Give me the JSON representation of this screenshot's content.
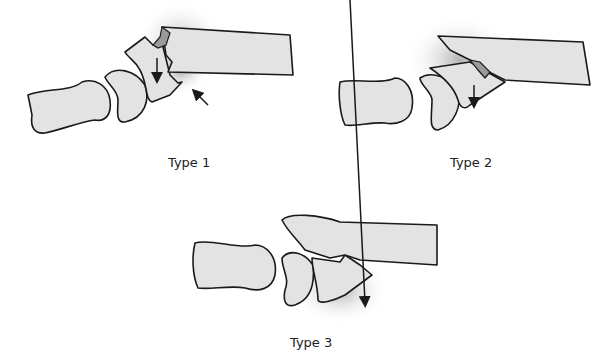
{
  "figure": {
    "panels": [
      {
        "id": "type-1",
        "label": "Type 1"
      },
      {
        "id": "type-2",
        "label": "Type 2"
      },
      {
        "id": "type-3",
        "label": "Type 3"
      }
    ]
  },
  "colors": {
    "bone_fill": "#e3e3e3",
    "outline": "#1a1a1a",
    "fragment": "#9a9a9a",
    "shadow": "#b0b0b0",
    "background": "#ffffff"
  }
}
